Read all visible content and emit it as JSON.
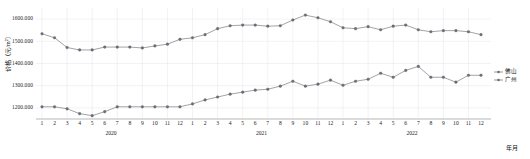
{
  "chart_data": {
    "type": "line",
    "title": "",
    "xlabel": "年月",
    "ylabel": "价格（元/m²）",
    "ylim": [
      1150000,
      1650000
    ],
    "yticks": [
      1200.0,
      1300.0,
      1400.0,
      1500.0,
      1600.0
    ],
    "ytick_labels": [
      "1200.000",
      "1300.000",
      "1400.000",
      "1500.000",
      "1600.000"
    ],
    "grid": true,
    "legend_position": "right",
    "x": [
      "2020-1",
      "2020-2",
      "2020-3",
      "2020-4",
      "2020-5",
      "2020-6",
      "2020-7",
      "2020-8",
      "2020-9",
      "2020-10",
      "2020-11",
      "2020-12",
      "2021-1",
      "2021-2",
      "2021-3",
      "2021-4",
      "2021-5",
      "2021-6",
      "2021-7",
      "2021-8",
      "2021-9",
      "2021-10",
      "2021-11",
      "2021-12",
      "2022-1",
      "2022-2",
      "2022-3",
      "2022-4",
      "2022-5",
      "2022-6",
      "2022-7",
      "2022-8",
      "2022-9",
      "2022-10",
      "2022-11",
      "2022-12"
    ],
    "xtick_labels": [
      "1",
      "2",
      "3",
      "4",
      "5",
      "6",
      "7",
      "8",
      "9",
      "10",
      "11",
      "12",
      "1",
      "2",
      "3",
      "4",
      "5",
      "6",
      "7",
      "8",
      "9",
      "10",
      "11",
      "12",
      "1",
      "2",
      "3",
      "4",
      "5",
      "6",
      "7",
      "8",
      "9",
      "10",
      "11",
      "12"
    ],
    "year_groups": [
      {
        "label": "2020",
        "center_index": 5.5
      },
      {
        "label": "2021",
        "center_index": 17.5
      },
      {
        "label": "2022",
        "center_index": 29.5
      }
    ],
    "series": [
      {
        "name": "佛山",
        "color": "#6f6f78",
        "values": [
          1534.0,
          1516.0,
          1472.0,
          1461.0,
          1461.0,
          1474.0,
          1474.0,
          1474.0,
          1470.0,
          1479.0,
          1487.0,
          1509.0,
          1516.0,
          1530.0,
          1557.0,
          1570.0,
          1573.0,
          1573.0,
          1568.0,
          1570.0,
          1596.0,
          1618.0,
          1606.0,
          1588.0,
          1561.0,
          1557.0,
          1566.0,
          1552.0,
          1568.0,
          1573.0,
          1552.0,
          1543.0,
          1548.0,
          1548.0,
          1543.0,
          1530.0
        ]
      },
      {
        "name": "广州",
        "color": "#6f6f78",
        "values": [
          1205.0,
          1205.0,
          1196.0,
          1174.0,
          1165.0,
          1183.0,
          1205.0,
          1205.0,
          1205.0,
          1205.0,
          1205.0,
          1205.0,
          1218.0,
          1236.0,
          1249.0,
          1262.0,
          1271.0,
          1280.0,
          1284.0,
          1298.0,
          1320.0,
          1298.0,
          1307.0,
          1325.0,
          1302.0,
          1320.0,
          1329.0,
          1356.0,
          1338.0,
          1369.0,
          1387.0,
          1338.0,
          1338.0,
          1316.0,
          1347.0,
          1347.0
        ]
      }
    ]
  }
}
